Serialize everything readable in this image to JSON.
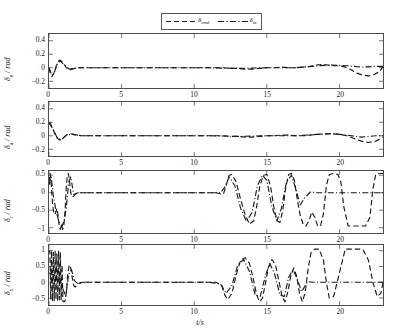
{
  "figure": {
    "xlabel": "t/s",
    "legend": {
      "entries": [
        {
          "label": "δ",
          "sub": "cmd",
          "style": "dashed",
          "color": "#1a1a1a",
          "name": "legend-entry-delta-cmd"
        },
        {
          "label": "δ",
          "sub": "ac",
          "style": "dashdot",
          "color": "#1a1a1a",
          "name": "legend-entry-delta-ac"
        }
      ]
    }
  },
  "chart_data": {
    "type": "line",
    "title": "",
    "xlabel": "t/s",
    "ylabel": "δ / rad",
    "xlim": [
      0,
      23
    ],
    "xticks": [
      0,
      5,
      10,
      15,
      20
    ],
    "grid": false,
    "legend_position": "top-center",
    "panels": [
      {
        "name": "panel-delta-e",
        "ylabel": "δ",
        "ylabel_sub": "e",
        "ylabel_units": "/ rad",
        "ylim": [
          -0.3,
          0.5
        ],
        "yticks": [
          0.4,
          0.2,
          0,
          -0.2
        ],
        "ytick_labels": [
          "0.4",
          "0.2",
          "0",
          "−0.2"
        ],
        "series": [
          {
            "name": "δ cmd",
            "style": "dashed",
            "color": "#1a1a1a",
            "x": [
              0,
              0.1,
              0.2,
              0.3,
              0.4,
              0.5,
              0.6,
              0.7,
              0.8,
              0.9,
              1.0,
              1.1,
              1.2,
              1.3,
              1.4,
              1.5,
              1.6,
              1.8,
              2.0,
              2.3,
              2.6,
              3.0,
              3.5,
              4.0,
              5.0,
              6.0,
              7.0,
              8.0,
              9.0,
              10.0,
              11.0,
              12.0,
              12.5,
              13.0,
              13.5,
              14.0,
              14.5,
              15.0,
              15.5,
              16.0,
              16.5,
              17.0,
              17.5,
              18.0,
              18.4,
              18.8,
              19.2,
              19.6,
              20.0,
              20.4,
              20.8,
              21.2,
              21.6,
              22.0,
              22.4,
              22.8,
              23.0
            ],
            "y": [
              0,
              -0.09,
              -0.13,
              -0.1,
              -0.04,
              0.03,
              0.08,
              0.11,
              0.11,
              0.09,
              0.06,
              0.03,
              0.0,
              -0.02,
              -0.03,
              -0.03,
              -0.02,
              -0.01,
              0.0,
              0.0,
              0.0,
              0.0,
              0.0,
              0.0,
              0.0,
              0.0,
              0.0,
              0.0,
              0.0,
              0.0,
              0.0,
              0.0,
              -0.01,
              -0.01,
              -0.02,
              -0.02,
              -0.01,
              0.0,
              0.0,
              0.01,
              0.0,
              0.0,
              0.01,
              0.02,
              0.04,
              0.05,
              0.04,
              0.03,
              0.03,
              0.01,
              -0.03,
              -0.08,
              -0.11,
              -0.12,
              -0.1,
              -0.05,
              0.02
            ]
          },
          {
            "name": "δ ac",
            "style": "dashdot",
            "color": "#1a1a1a",
            "x": [
              0,
              0.2,
              0.4,
              0.6,
              0.8,
              1.0,
              1.4,
              2.0,
              3.0,
              5.0,
              8.0,
              11.0,
              13.0,
              15.0,
              17.0,
              18.5,
              19.5,
              20.5,
              21.5,
              22.5,
              23.0
            ],
            "y": [
              0,
              -0.11,
              -0.05,
              0.07,
              0.1,
              0.05,
              -0.02,
              0.0,
              0.0,
              0.0,
              0.0,
              0.0,
              -0.01,
              0.0,
              0.0,
              0.03,
              0.04,
              0.03,
              0.01,
              0.02,
              0.02
            ]
          }
        ]
      },
      {
        "name": "panel-delta-a",
        "ylabel": "δ",
        "ylabel_sub": "a",
        "ylabel_units": "/ rad",
        "ylim": [
          -0.3,
          0.5
        ],
        "yticks": [
          0.4,
          0.2,
          0,
          -0.2
        ],
        "ytick_labels": [
          "0.4",
          "0.2",
          "0",
          "−0.2"
        ],
        "series": [
          {
            "name": "δ cmd",
            "style": "dashed",
            "color": "#1a1a1a",
            "x": [
              0,
              0.1,
              0.2,
              0.3,
              0.4,
              0.5,
              0.6,
              0.7,
              0.8,
              0.9,
              1.0,
              1.1,
              1.2,
              1.3,
              1.4,
              1.5,
              1.7,
              1.9,
              2.2,
              2.6,
              3.0,
              3.5,
              4.0,
              5.0,
              6.0,
              7.0,
              8.0,
              9.0,
              10.0,
              11.0,
              12.0,
              12.5,
              13.0,
              13.5,
              14.0,
              14.5,
              15.0,
              15.5,
              16.0,
              16.5,
              17.0,
              17.5,
              18.0,
              18.5,
              19.0,
              19.5,
              20.0,
              20.5,
              21.0,
              21.5,
              22.0,
              22.5,
              23.0
            ],
            "y": [
              0.2,
              0.18,
              0.13,
              0.08,
              0.03,
              -0.01,
              -0.04,
              -0.06,
              -0.06,
              -0.05,
              -0.03,
              -0.01,
              0.01,
              0.02,
              0.03,
              0.03,
              0.02,
              0.01,
              0.0,
              0.0,
              0.0,
              0.0,
              0.0,
              0.0,
              0.0,
              0.0,
              0.0,
              0.0,
              0.0,
              0.0,
              0.0,
              -0.01,
              -0.01,
              -0.02,
              -0.02,
              -0.01,
              0.0,
              0.0,
              0.01,
              0.01,
              0.0,
              0.0,
              0.01,
              0.02,
              0.03,
              0.03,
              0.02,
              0.0,
              -0.04,
              -0.08,
              -0.1,
              -0.08,
              -0.02
            ]
          },
          {
            "name": "δ ac",
            "style": "dashdot",
            "color": "#1a1a1a",
            "x": [
              0,
              0.3,
              0.6,
              0.9,
              1.2,
              1.6,
              2.2,
              3.0,
              5.0,
              8.0,
              11.0,
              13.0,
              15.0,
              17.0,
              18.5,
              19.5,
              20.5,
              21.5,
              22.5,
              23.0
            ],
            "y": [
              0.19,
              0.09,
              -0.05,
              -0.05,
              0.01,
              0.02,
              0.0,
              0.0,
              0.0,
              0.0,
              0.0,
              -0.01,
              0.0,
              0.0,
              0.02,
              0.03,
              0.01,
              -0.02,
              0.0,
              0.0
            ]
          }
        ]
      },
      {
        "name": "panel-delta-r",
        "ylabel": "δ",
        "ylabel_sub": "r",
        "ylabel_units": "/ rad",
        "ylim": [
          -1.15,
          0.62
        ],
        "yticks": [
          0.5,
          0,
          -0.5,
          -1
        ],
        "ytick_labels": [
          "0.5",
          "0",
          "−0.5",
          "−1"
        ],
        "series": [
          {
            "name": "δ cmd",
            "style": "dashed",
            "color": "#1a1a1a",
            "x": [
              0,
              0.08,
              0.16,
              0.25,
              0.35,
              0.45,
              0.55,
              0.62,
              0.7,
              0.78,
              0.86,
              0.94,
              1.02,
              1.1,
              1.18,
              1.26,
              1.34,
              1.42,
              1.5,
              1.6,
              1.7,
              1.85,
              2.0,
              2.2,
              2.5,
              3.0,
              4.0,
              6.0,
              8.0,
              10.0,
              11.5,
              12.0,
              12.2,
              12.4,
              12.6,
              12.9,
              13.2,
              13.5,
              13.8,
              14.1,
              14.3,
              14.5,
              14.75,
              15.0,
              15.25,
              15.5,
              15.7,
              15.9,
              16.1,
              16.3,
              16.5,
              16.7,
              16.9,
              17.1,
              17.3,
              17.5,
              17.7,
              17.9,
              18.1,
              18.3,
              18.5,
              18.7,
              18.9,
              19.1,
              19.3,
              19.6,
              19.9,
              20.1,
              20.3,
              20.6,
              21.0,
              21.4,
              21.8,
              22.1,
              22.3,
              22.5,
              22.7,
              22.9,
              23.0
            ],
            "y": [
              0.3,
              0.55,
              0.2,
              -0.35,
              -0.62,
              -0.58,
              -0.45,
              -0.62,
              -0.95,
              -1.05,
              -0.9,
              -1.05,
              -0.95,
              -0.55,
              0.1,
              0.5,
              0.55,
              0.3,
              0.0,
              -0.12,
              -0.1,
              -0.03,
              0.0,
              0.0,
              0.0,
              0.0,
              0.0,
              0.0,
              0.0,
              0.0,
              0.0,
              -0.05,
              0.2,
              0.5,
              0.52,
              0.3,
              -0.2,
              -0.62,
              -0.9,
              -0.8,
              -0.4,
              0.15,
              0.5,
              0.52,
              0.2,
              -0.45,
              -0.8,
              -0.85,
              -0.5,
              0.15,
              0.52,
              0.55,
              0.35,
              -0.2,
              -0.65,
              -0.9,
              -0.95,
              -0.8,
              -0.55,
              -0.7,
              -0.95,
              -0.95,
              -0.6,
              0.2,
              0.52,
              0.55,
              0.52,
              0.3,
              -0.4,
              -0.95,
              -0.95,
              -0.95,
              -0.95,
              -0.7,
              0.1,
              0.52,
              0.55,
              0.55,
              0.55
            ]
          },
          {
            "name": "δ ac",
            "style": "dashdot",
            "color": "#1a1a1a",
            "x": [
              0,
              0.15,
              0.3,
              0.5,
              0.7,
              0.9,
              1.05,
              1.2,
              1.35,
              1.5,
              1.7,
              2.0,
              2.5,
              4.0,
              7.0,
              10.0,
              11.8,
              12.1,
              12.4,
              12.8,
              13.2,
              13.6,
              14.0,
              14.35,
              14.7,
              15.0,
              15.35,
              15.7,
              16.0,
              16.35,
              16.7,
              17.0,
              17.3,
              17.6,
              18.0,
              18.5,
              19.0,
              19.5,
              20.0,
              20.5,
              21.0,
              21.5,
              22.0,
              22.5,
              23.0
            ],
            "y": [
              0.22,
              0.45,
              -0.1,
              -0.55,
              -0.85,
              -0.95,
              -0.8,
              -0.4,
              0.3,
              0.45,
              -0.05,
              0.0,
              0.0,
              0.0,
              0.0,
              0.0,
              0.0,
              0.15,
              0.45,
              0.2,
              -0.45,
              -0.82,
              -0.55,
              0.2,
              0.5,
              0.35,
              -0.4,
              -0.8,
              -0.45,
              0.3,
              0.5,
              0.1,
              -0.35,
              -0.15,
              0.02,
              0.0,
              0.0,
              0.0,
              0.0,
              0.0,
              0.0,
              0.0,
              0.0,
              0.0,
              0.0
            ]
          }
        ]
      },
      {
        "name": "panel-delta-t",
        "ylabel": "δ",
        "ylabel_sub": "x",
        "ylabel_units": "/ rad",
        "ylim": [
          -0.72,
          1.18
        ],
        "yticks": [
          1,
          0.5,
          0,
          -0.5
        ],
        "ytick_labels": [
          "1",
          "0.5",
          "0",
          "−0.5"
        ],
        "series": [
          {
            "name": "δ cmd",
            "style": "dashed",
            "color": "#1a1a1a",
            "x": [
              0,
              0.06,
              0.12,
              0.18,
              0.24,
              0.3,
              0.36,
              0.42,
              0.48,
              0.54,
              0.6,
              0.66,
              0.72,
              0.78,
              0.84,
              0.9,
              0.96,
              1.02,
              1.1,
              1.2,
              1.3,
              1.4,
              1.5,
              1.6,
              1.7,
              1.8,
              1.95,
              2.1,
              2.3,
              2.6,
              3.0,
              4.0,
              6.0,
              8.0,
              10.0,
              11.5,
              11.9,
              12.1,
              12.3,
              12.6,
              12.9,
              13.2,
              13.5,
              13.8,
              14.05,
              14.3,
              14.5,
              14.7,
              14.9,
              15.1,
              15.35,
              15.6,
              15.85,
              16.05,
              16.25,
              16.45,
              16.65,
              16.85,
              17.05,
              17.25,
              17.45,
              17.65,
              17.85,
              18.05,
              18.3,
              18.6,
              18.9,
              19.1,
              19.3,
              19.6,
              20.0,
              20.4,
              20.8,
              21.2,
              21.6,
              22.0,
              22.3,
              22.6,
              22.85,
              23.0
            ],
            "y": [
              0.95,
              1.0,
              -0.55,
              1.0,
              -0.6,
              0.95,
              -0.58,
              1.0,
              -0.55,
              0.9,
              -0.6,
              1.0,
              -0.55,
              0.95,
              -0.58,
              0.55,
              -0.6,
              -0.62,
              -0.6,
              -0.3,
              0.3,
              0.55,
              0.45,
              0.15,
              -0.1,
              -0.15,
              -0.08,
              -0.02,
              0.0,
              0.0,
              0.0,
              0.0,
              0.0,
              0.0,
              0.0,
              0.0,
              -0.1,
              -0.4,
              -0.55,
              -0.35,
              0.25,
              0.7,
              0.78,
              0.6,
              0.15,
              -0.4,
              -0.62,
              -0.5,
              -0.05,
              0.45,
              0.72,
              0.55,
              0.0,
              -0.45,
              -0.62,
              -0.3,
              0.2,
              0.45,
              0.2,
              -0.35,
              -0.62,
              -0.3,
              0.45,
              0.95,
              1.05,
              1.05,
              0.7,
              0.0,
              -0.5,
              -0.45,
              0.3,
              1.05,
              1.05,
              1.05,
              1.05,
              0.7,
              0.0,
              -0.45,
              -0.35,
              0.0
            ]
          },
          {
            "name": "δ ac",
            "style": "dashdot",
            "color": "#1a1a1a",
            "x": [
              0,
              0.2,
              0.45,
              0.7,
              0.95,
              1.15,
              1.35,
              1.55,
              1.75,
              2.0,
              2.4,
              3.0,
              5.0,
              8.0,
              11.0,
              11.8,
              12.2,
              12.6,
              13.0,
              13.4,
              13.8,
              14.2,
              14.55,
              14.9,
              15.2,
              15.55,
              15.9,
              16.2,
              16.5,
              16.8,
              17.1,
              17.4,
              17.8,
              18.2,
              18.7,
              19.2,
              19.7,
              20.2,
              20.8,
              21.4,
              22.0,
              22.6,
              23.0
            ],
            "y": [
              0.3,
              0.25,
              0.2,
              0.15,
              -0.2,
              -0.45,
              0.25,
              0.4,
              0.05,
              -0.05,
              0.0,
              0.0,
              0.0,
              0.0,
              0.0,
              -0.05,
              -0.35,
              -0.1,
              0.55,
              0.72,
              0.35,
              -0.4,
              -0.45,
              0.2,
              0.6,
              0.25,
              -0.4,
              -0.45,
              0.15,
              0.4,
              0.1,
              -0.3,
              0.02,
              0.0,
              0.0,
              0.0,
              0.0,
              0.0,
              0.0,
              0.0,
              0.0,
              0.0,
              0.0
            ]
          }
        ]
      }
    ]
  }
}
